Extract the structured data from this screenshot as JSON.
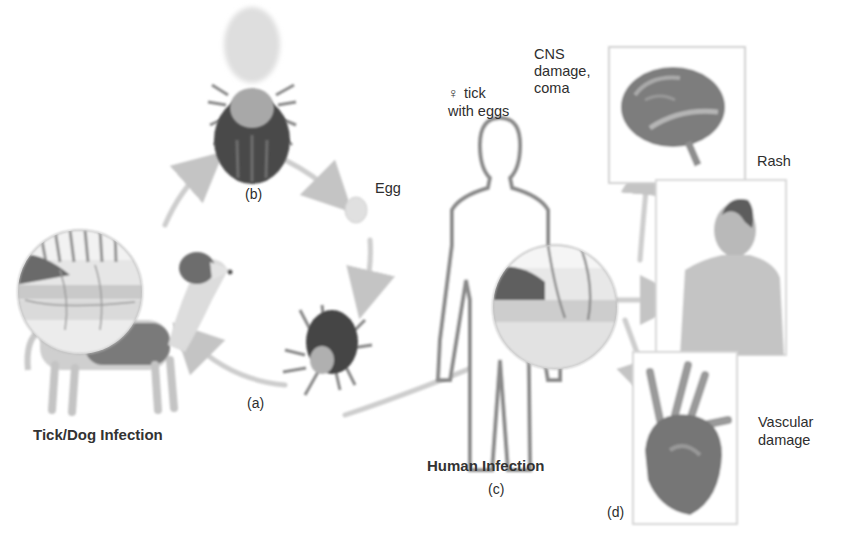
{
  "figure": {
    "panels": {
      "a": {
        "label": "(a)"
      },
      "b": {
        "label": "(b)"
      },
      "c": {
        "label": "(c)"
      },
      "d": {
        "label": "(d)"
      }
    },
    "labels": {
      "female_tick": "tick",
      "female_symbol": "♀",
      "female_tick_line2": "with eggs",
      "egg": "Egg",
      "tick_dog_infection": "Tick/Dog Infection",
      "human_infection": "Human Infection",
      "cns_line1": "CNS",
      "cns_line2": "damage,",
      "cns_line3": "coma",
      "rash": "Rash",
      "vascular_line1": "Vascular",
      "vascular_line2": "damage"
    },
    "colors": {
      "background": "#ffffff",
      "text": "#2e2e2e",
      "arrow": "#c8c8c8",
      "tick_dark": "#3a3a3a",
      "tissue_gray": "#b8b8b8",
      "frame": "#d0d0d0"
    }
  }
}
